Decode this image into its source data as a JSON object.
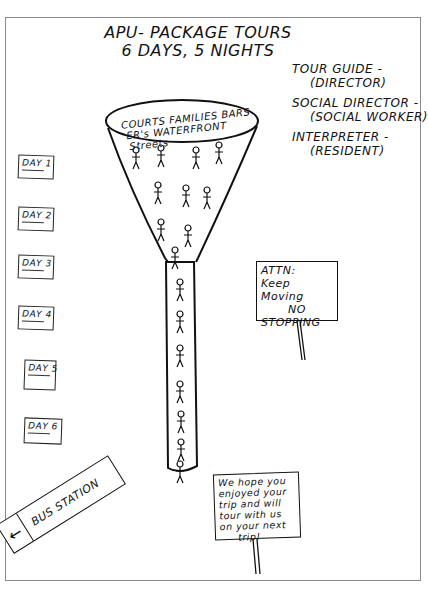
{
  "title": {
    "line1": "APU- PACKAGE TOURS",
    "line2": "6 DAYS, 5 NIGHTS"
  },
  "roles": [
    {
      "role": "TOUR GUIDE -",
      "who": "(DIRECTOR)"
    },
    {
      "role": "SOCIAL DIRECTOR -",
      "who": "(SOCIAL WORKER)"
    },
    {
      "role": "INTERPRETER -",
      "who": "(RESIDENT)"
    }
  ],
  "funnel": {
    "labels_line1": "COURTS  FAMILIES  BARS",
    "labels_line2": "ER's  WATERFRONT",
    "labels_line3": "Streets"
  },
  "days": [
    {
      "label": "DAY 1"
    },
    {
      "label": "DAY 2"
    },
    {
      "label": "DAY 3"
    },
    {
      "label": "DAY 4"
    },
    {
      "label": "DAY 5"
    },
    {
      "label": "DAY 6"
    }
  ],
  "sign_attn": {
    "line1": "ATTN:",
    "line2": "Keep Moving",
    "line3": "NO",
    "line4": "STOPPING"
  },
  "sign_farewell": {
    "line1": "We hope you",
    "line2": "enjoyed your",
    "line3": "trip and will",
    "line4": "tour with us",
    "line5": "on your next",
    "line6": "trip!"
  },
  "bus_sign": {
    "arrow": "←",
    "label": "BUS STATION"
  }
}
